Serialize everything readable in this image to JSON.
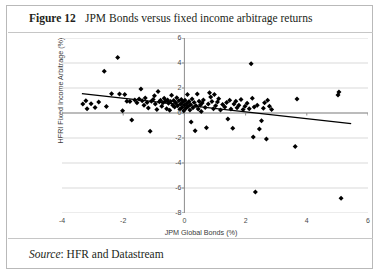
{
  "figure": {
    "label": "Figure 12",
    "title": "JPM Bonds versus fixed income arbitrage returns",
    "source_keyword": "Source",
    "source_text": ": HFR and Datastream"
  },
  "chart_data": {
    "type": "scatter",
    "title": "JPM Bonds versus fixed income arbitrage returns",
    "xlabel": "JPM Global Bonds (%)",
    "ylabel": "HFRI Fixed Income Arbitrage (%)",
    "xlim": [
      -4,
      6
    ],
    "ylim": [
      -8,
      6
    ],
    "xticks": [
      -4,
      -2,
      0,
      2,
      4,
      6
    ],
    "yticks": [
      6,
      4,
      2,
      0,
      -2,
      -4,
      -6,
      -8
    ],
    "grid": "horizontal",
    "legend": "none",
    "marker": "diamond",
    "marker_color": "#000000",
    "trendline": {
      "visible": true,
      "color": "#000000",
      "x_start": -3.35,
      "y_start": 1.55,
      "x_end": 5.45,
      "y_end": -0.85
    },
    "points": [
      [
        -3.32,
        0.72
      ],
      [
        -3.22,
        0.98
      ],
      [
        -3.18,
        0.35
      ],
      [
        -3.05,
        0.75
      ],
      [
        -2.92,
        0.45
      ],
      [
        -2.8,
        0.88
      ],
      [
        -2.62,
        3.35
      ],
      [
        -2.55,
        0.52
      ],
      [
        -2.38,
        1.55
      ],
      [
        -2.18,
        4.45
      ],
      [
        -2.12,
        1.52
      ],
      [
        -2.02,
        0.18
      ],
      [
        -1.95,
        1.48
      ],
      [
        -1.88,
        0.95
      ],
      [
        -1.78,
        0.92
      ],
      [
        -1.72,
        -0.55
      ],
      [
        -1.62,
        1.05
      ],
      [
        -1.55,
        0.82
      ],
      [
        -1.48,
        1.12
      ],
      [
        -1.42,
        1.92
      ],
      [
        -1.38,
        0.98
      ],
      [
        -1.32,
        0.62
      ],
      [
        -1.28,
        1.2
      ],
      [
        -1.22,
        0.85
      ],
      [
        -1.18,
        0.4
      ],
      [
        -1.12,
        -1.45
      ],
      [
        -1.08,
        0.95
      ],
      [
        -1.02,
        1.08
      ],
      [
        -0.98,
        1.38
      ],
      [
        -0.95,
        0.72
      ],
      [
        -0.9,
        0.28
      ],
      [
        -0.86,
        1.72
      ],
      [
        -0.82,
        0.9
      ],
      [
        -0.78,
        1.02
      ],
      [
        -0.74,
        0.55
      ],
      [
        -0.7,
        0.82
      ],
      [
        -0.66,
        1.18
      ],
      [
        -0.62,
        0.95
      ],
      [
        -0.58,
        0.35
      ],
      [
        -0.55,
        1.05
      ],
      [
        -0.52,
        0.78
      ],
      [
        -0.48,
        0.22
      ],
      [
        -0.45,
        0.92
      ],
      [
        -0.42,
        1.42
      ],
      [
        -0.38,
        0.62
      ],
      [
        -0.35,
        1.0
      ],
      [
        -0.32,
        0.48
      ],
      [
        -0.28,
        0.82
      ],
      [
        -0.25,
        1.22
      ],
      [
        -0.22,
        0.58
      ],
      [
        -0.18,
        0.98
      ],
      [
        -0.15,
        0.3
      ],
      [
        -0.12,
        0.72
      ],
      [
        -0.1,
        1.08
      ],
      [
        -0.08,
        0.45
      ],
      [
        -0.05,
        0.88
      ],
      [
        -0.02,
        0.18
      ],
      [
        0.0,
        0.62
      ],
      [
        0.02,
        1.02
      ],
      [
        0.05,
        0.38
      ],
      [
        0.08,
        0.78
      ],
      [
        0.1,
        1.48
      ],
      [
        0.12,
        0.52
      ],
      [
        0.15,
        0.92
      ],
      [
        0.18,
        0.25
      ],
      [
        0.2,
        0.68
      ],
      [
        0.22,
        -0.72
      ],
      [
        0.25,
        1.12
      ],
      [
        0.28,
        0.42
      ],
      [
        0.32,
        0.85
      ],
      [
        0.35,
        -1.42
      ],
      [
        0.38,
        0.58
      ],
      [
        0.42,
        1.52
      ],
      [
        0.45,
        0.32
      ],
      [
        0.48,
        0.95
      ],
      [
        0.52,
        0.65
      ],
      [
        0.55,
        0.12
      ],
      [
        0.58,
        0.8
      ],
      [
        0.62,
        1.05
      ],
      [
        0.68,
        0.45
      ],
      [
        0.72,
        -1.18
      ],
      [
        0.78,
        0.72
      ],
      [
        0.82,
        1.62
      ],
      [
        0.86,
        1.28
      ],
      [
        0.9,
        0.92
      ],
      [
        0.95,
        0.35
      ],
      [
        0.98,
        1.48
      ],
      [
        1.02,
        0.58
      ],
      [
        1.08,
        0.88
      ],
      [
        1.12,
        1.15
      ],
      [
        1.18,
        0.25
      ],
      [
        1.25,
        0.68
      ],
      [
        1.32,
        0.48
      ],
      [
        1.38,
        0.85
      ],
      [
        1.42,
        -0.48
      ],
      [
        1.48,
        1.02
      ],
      [
        1.52,
        0.32
      ],
      [
        1.58,
        -1.22
      ],
      [
        1.62,
        0.72
      ],
      [
        1.68,
        0.95
      ],
      [
        1.72,
        0.42
      ],
      [
        1.78,
        0.62
      ],
      [
        1.85,
        1.08
      ],
      [
        1.92,
        0.28
      ],
      [
        1.98,
        0.55
      ],
      [
        2.05,
        0.78
      ],
      [
        2.12,
        0.35
      ],
      [
        2.18,
        3.95
      ],
      [
        2.22,
        1.18
      ],
      [
        2.25,
        -1.92
      ],
      [
        2.28,
        0.48
      ],
      [
        2.32,
        -6.32
      ],
      [
        2.38,
        0.62
      ],
      [
        2.45,
        -1.28
      ],
      [
        2.52,
        -0.62
      ],
      [
        2.58,
        0.38
      ],
      [
        2.62,
        0.82
      ],
      [
        2.68,
        -2.08
      ],
      [
        2.72,
        1.02
      ],
      [
        2.78,
        0.55
      ],
      [
        2.85,
        0.28
      ],
      [
        3.62,
        -2.68
      ],
      [
        3.68,
        1.12
      ],
      [
        5.02,
        1.45
      ],
      [
        5.05,
        1.68
      ],
      [
        5.12,
        -6.82
      ]
    ]
  }
}
